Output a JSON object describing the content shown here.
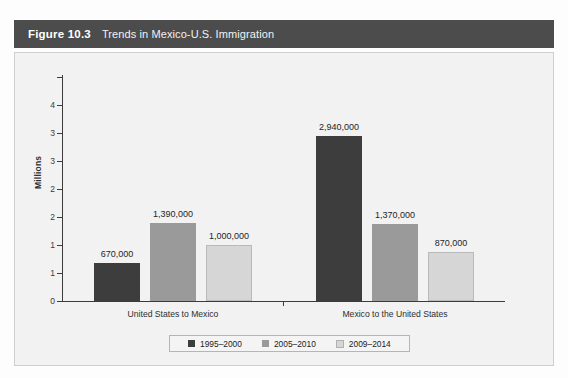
{
  "figure": {
    "number_label": "Figure 10.3",
    "title": "Trends in Mexico-U.S. Immigration"
  },
  "colors": {
    "header_bar": "#4c4c4c",
    "panel_bg": "#f2f2f2",
    "series_1995_2000": "#3d3d3d",
    "series_2005_2010": "#9a9a9a",
    "series_2009_2014": "#d6d6d6",
    "axis": "#3c3c3c"
  },
  "chart_data": {
    "type": "bar",
    "title": "Trends in Mexico-U.S. Immigration",
    "xlabel": "",
    "ylabel": "Millions",
    "ylim": [
      0,
      4
    ],
    "ytick_values": [
      0,
      0.5,
      1,
      1.5,
      2,
      2.5,
      3,
      3.5,
      4
    ],
    "ytick_labels": [
      "0",
      "1",
      "1",
      "2",
      "2",
      "3",
      "3",
      "4"
    ],
    "ytick_labels_bottom_to_top": [
      "0",
      "1",
      "1",
      "2",
      "2",
      "3",
      "3",
      "4"
    ],
    "grid": false,
    "legend_position": "bottom",
    "categories": [
      "United States to Mexico",
      "Mexico to the United States"
    ],
    "series": [
      {
        "name": "1995–2000",
        "color": "#3d3d3d",
        "values": [
          670000,
          2940000
        ],
        "value_labels": [
          "670,000",
          "2,940,000"
        ]
      },
      {
        "name": "2005–2010",
        "color": "#9a9a9a",
        "values": [
          1390000,
          1370000
        ],
        "value_labels": [
          "1,390,000",
          "1,370,000"
        ]
      },
      {
        "name": "2009–2014",
        "color": "#d6d6d6",
        "values": [
          1000000,
          870000
        ],
        "value_labels": [
          "1,000,000",
          "870,000"
        ]
      }
    ]
  },
  "legend": {
    "items": [
      {
        "label": "1995–2000"
      },
      {
        "label": "2005–2010"
      },
      {
        "label": "2009–2014"
      }
    ]
  }
}
